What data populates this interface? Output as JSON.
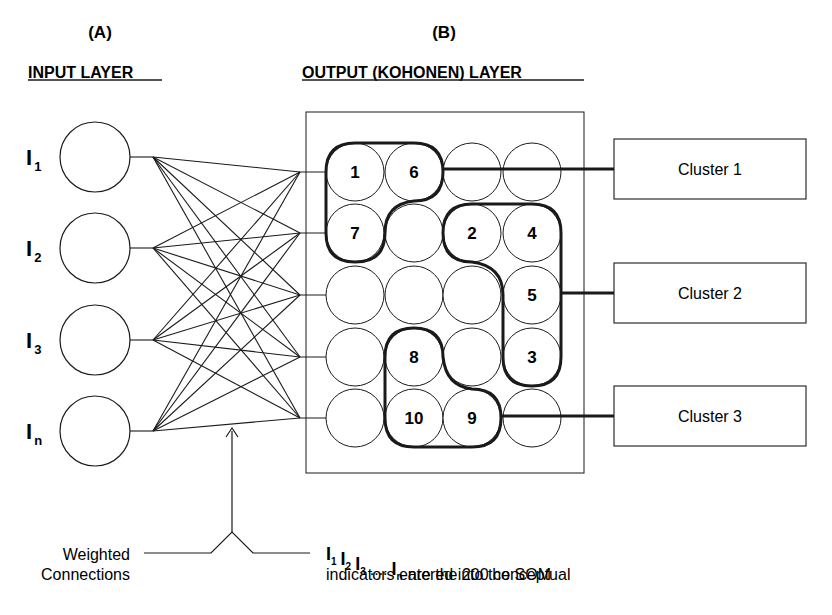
{
  "panel_a": {
    "tag": "(A)",
    "title": "INPUT LAYER"
  },
  "panel_b": {
    "tag": "(B)",
    "title": "OUTPUT (KOHONEN) LAYER"
  },
  "inputs": [
    {
      "label": "I",
      "sub": "1",
      "cy": 157
    },
    {
      "label": "I",
      "sub": "2",
      "cy": 248
    },
    {
      "label": "I",
      "sub": "3",
      "cy": 340
    },
    {
      "label": "I",
      "sub": "n",
      "cy": 431
    }
  ],
  "grid": {
    "cols": [
      355,
      414,
      472,
      532
    ],
    "rows": [
      172,
      233,
      295,
      357,
      418
    ],
    "radius": 29,
    "labels": [
      [
        "1",
        "6",
        "",
        ""
      ],
      [
        "7",
        "",
        "2",
        "4"
      ],
      [
        "",
        "",
        "",
        "5"
      ],
      [
        "",
        "8",
        "",
        "3"
      ],
      [
        "",
        "10",
        "9",
        ""
      ]
    ]
  },
  "clusters": [
    {
      "label": "Cluster 1",
      "y": 169
    },
    {
      "label": "Cluster 2",
      "y": 293
    },
    {
      "label": "Cluster 3",
      "y": 416
    }
  ],
  "annotations": {
    "weighted_line1": "Weighted",
    "weighted_line2": "Connections",
    "indicators_line1_suffix": "are the 200 conceptual",
    "indicators_line2": "indicators entered into the SOM",
    "ellipsis": "....",
    "indicator_subs": [
      "1",
      "2",
      "3",
      "n"
    ]
  },
  "colors": {
    "ink": "#1a1a1a",
    "background": "#ffffff"
  }
}
